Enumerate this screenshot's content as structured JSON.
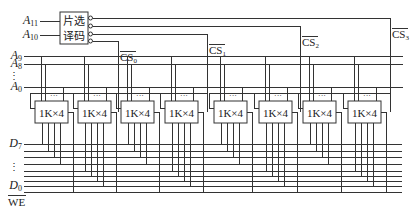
{
  "diagram": {
    "decoder": {
      "line1": "片选",
      "line2": "译码",
      "inputs": [
        "A11",
        "A10"
      ]
    },
    "address_labels": [
      {
        "main": "A",
        "sub": "9"
      },
      {
        "main": "A",
        "sub": "8"
      },
      {
        "main": "A",
        "sub": "0"
      }
    ],
    "data_labels": [
      {
        "main": "D",
        "sub": "7"
      },
      {
        "main": "D",
        "sub": "0"
      }
    ],
    "we_label": "WE",
    "chip_select_labels": [
      "CS0",
      "CS1",
      "CS2",
      "CS3"
    ],
    "chip_label": "1K×4",
    "chip_count": 8,
    "ellipsis": "⋮",
    "chip_dots": "···"
  }
}
